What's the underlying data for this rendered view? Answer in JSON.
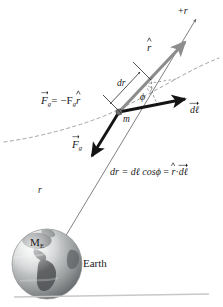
{
  "figure": {
    "background_color": "#ffffff",
    "labels": {
      "plus_r": "+r",
      "r_hat": "r",
      "dr": "dr",
      "phi": "ϕ",
      "mass": "m",
      "d_ell": "dℓ",
      "force_equation_lhs": "F",
      "force_equation_sub": "g",
      "force_equation_mid": "= −F",
      "force_equation_sub2": "g",
      "force_equation_rhat": "r",
      "force_vector": "F",
      "force_vector_sub": "g",
      "formula_part1": "dr = dℓ cos",
      "formula_phi": "ϕ",
      "formula_part2": "=",
      "formula_rhat": "r",
      "formula_dot": "·",
      "formula_dell": "dℓ",
      "radius": "r",
      "earth_mass": "M",
      "earth_mass_sub": "E",
      "earth": "Earth"
    },
    "colors": {
      "ink": "#1a1a1a",
      "rhat_vector": "#8d8d8d",
      "force_vector": "#141414",
      "dell_vector": "#141414",
      "radial_line": "#7a7a7a",
      "dashed_path": "#9a9a9a",
      "mass_dot": "#6e6e6e",
      "earth_land": "#55585a",
      "earth_ocean": "#c9cbcc",
      "rule": "#c8c8c8"
    },
    "geometry": {
      "mass_point": [
        119,
        112
      ],
      "rhat_arrow_tip": [
        200,
        16
      ],
      "dell_arrow_tip": [
        192,
        98
      ],
      "force_arrow_tip": [
        86,
        163
      ],
      "earth_center": [
        47,
        264
      ],
      "earth_radius": 35
    },
    "icon_names": [
      "earth-globe-icon",
      "rhat-unit-vector-arrow",
      "gravity-force-vector-arrow",
      "displacement-vector-arrow",
      "dashed-trajectory-path",
      "dr-measurement-bracket",
      "phi-angle-arc",
      "mass-point-dot"
    ]
  }
}
